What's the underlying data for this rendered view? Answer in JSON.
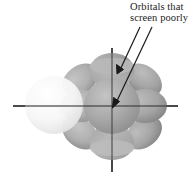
{
  "figure": {
    "name": "d-orbital-screening-diagram",
    "background_color": "#ffffff",
    "width": 194,
    "height": 184
  },
  "annotation": {
    "line1": "Orbitals that",
    "line2": "screen poorly",
    "text_color": "#1b1b1b",
    "arrow_color": "#1a1a1a",
    "arrows": [
      {
        "name": "arrow-to-top-lobe",
        "x1": 140,
        "y1": 27,
        "x2": 117,
        "y2": 73
      },
      {
        "name": "arrow-to-center-sphere",
        "x1": 152,
        "y1": 27,
        "x2": 113,
        "y2": 107
      }
    ]
  },
  "axes": {
    "horizontal": {
      "x1": 13,
      "y1": 106,
      "x2": 178,
      "y2": 106,
      "color": "#2b2b2b"
    },
    "vertical": {
      "x1": 112,
      "y1": 48,
      "x2": 112,
      "y2": 172,
      "color": "#2b2b2b"
    }
  },
  "orbital_lobes": [
    {
      "name": "top-lobe",
      "shape": "cone",
      "fill": "#a9a9a9"
    },
    {
      "name": "bottom-lobe",
      "shape": "cone",
      "fill": "#aaaaaa"
    },
    {
      "name": "left-lobe",
      "shape": "petal",
      "fill": "#b4b4b4"
    },
    {
      "name": "right-lobe",
      "shape": "petal",
      "fill": "#a6a6a6"
    },
    {
      "name": "upper-left-lobe",
      "shape": "petal",
      "fill": "#b0b0b0"
    },
    {
      "name": "upper-right-lobe",
      "shape": "petal",
      "fill": "#a4a4a4"
    },
    {
      "name": "lower-left-lobe",
      "shape": "petal",
      "fill": "#b2b2b2"
    },
    {
      "name": "lower-right-lobe",
      "shape": "petal",
      "fill": "#a5a5a5"
    },
    {
      "name": "central-sphere",
      "shape": "sphere",
      "fill": "#a8a8a8"
    },
    {
      "name": "outer-shell-sphere",
      "shape": "sphere",
      "fill": "#f7f7f7"
    }
  ]
}
